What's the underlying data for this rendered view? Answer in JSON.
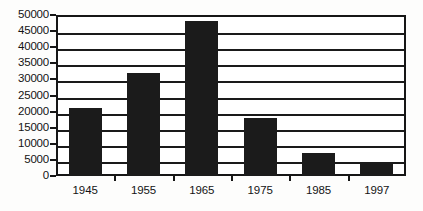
{
  "chart_data": {
    "type": "bar",
    "title": "",
    "subtitle": "",
    "xlabel": "",
    "ylabel": "",
    "categories": [
      "1945",
      "1955",
      "1965",
      "1975",
      "1985",
      "1997"
    ],
    "values": [
      21000,
      32000,
      48000,
      18000,
      7000,
      4500
    ],
    "series": [
      {
        "name": "",
        "values": [
          21000,
          32000,
          48000,
          18000,
          7000,
          4500
        ]
      }
    ],
    "ylim": [
      0,
      50000
    ],
    "yticks": [
      0,
      5000,
      10000,
      15000,
      20000,
      25000,
      30000,
      35000,
      40000,
      45000,
      50000
    ],
    "ytick_labels": [
      "0",
      "5000",
      "10000",
      "15000",
      "20000",
      "25000",
      "30000",
      "35000",
      "40000",
      "45000",
      "50000"
    ],
    "grid": "horizontal",
    "legend": "none",
    "bar_color": "#1b1b1b",
    "axis_color": "#161616",
    "background_color": "#ffffff",
    "annotations": []
  }
}
